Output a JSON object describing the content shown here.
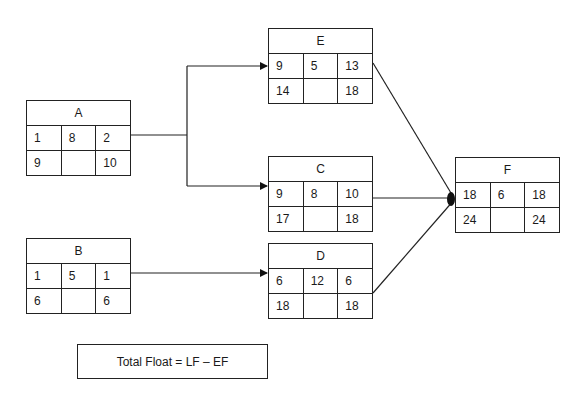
{
  "nodes": {
    "A": {
      "label": "A",
      "es": "1",
      "dur": "8",
      "ef": "2",
      "ls": "9",
      "float": "",
      "lf": "10"
    },
    "B": {
      "label": "B",
      "es": "1",
      "dur": "5",
      "ef": "1",
      "ls": "6",
      "float": "",
      "lf": "6"
    },
    "E": {
      "label": "E",
      "es": "9",
      "dur": "5",
      "ef": "13",
      "ls": "14",
      "float": "",
      "lf": "18"
    },
    "C": {
      "label": "C",
      "es": "9",
      "dur": "8",
      "ef": "10",
      "ls": "17",
      "float": "",
      "lf": "18"
    },
    "D": {
      "label": "D",
      "es": "6",
      "dur": "12",
      "ef": "6",
      "ls": "18",
      "float": "",
      "lf": "18"
    },
    "F": {
      "label": "F",
      "es": "18",
      "dur": "6",
      "ef": "18",
      "ls": "24",
      "float": "",
      "lf": "24"
    }
  },
  "edges": [
    {
      "from": "A",
      "to": "E"
    },
    {
      "from": "A",
      "to": "C"
    },
    {
      "from": "B",
      "to": "D"
    },
    {
      "from": "E",
      "to": "F"
    },
    {
      "from": "C",
      "to": "F"
    },
    {
      "from": "D",
      "to": "F"
    }
  ],
  "formula": "Total Float = LF – EF"
}
